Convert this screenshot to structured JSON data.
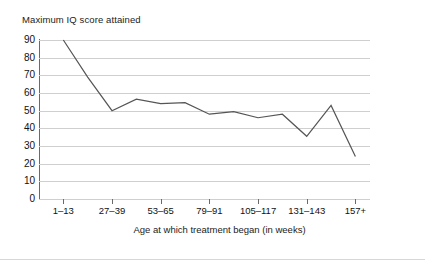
{
  "chart_data": {
    "type": "line",
    "title": "Maximum IQ score attained",
    "xlabel": "Age at which treatment began (in weeks)",
    "ylabel": "Maximum IQ score attained",
    "ylim": [
      0,
      90
    ],
    "ytick_labels": [
      "90",
      "80",
      "70",
      "60",
      "50",
      "40",
      "30",
      "20",
      "10",
      "0"
    ],
    "ytick_values": [
      90,
      80,
      70,
      60,
      50,
      40,
      30,
      20,
      10,
      0
    ],
    "grid": "horizontal",
    "legend": "none",
    "categories": [
      "1–13",
      "14–26",
      "27–39",
      "40–52",
      "53–65",
      "66–78",
      "79–91",
      "92–104",
      "105–117",
      "118–130",
      "131–143",
      "144–156",
      "157+"
    ],
    "xtick_labels": [
      "1–13",
      "27–39",
      "53–65",
      "79–91",
      "105–117",
      "131–143",
      "157+"
    ],
    "values": [
      90,
      69,
      50,
      56.5,
      54,
      54.5,
      48,
      49.5,
      46,
      48,
      35.5,
      53,
      24
    ],
    "line_color": "#555555",
    "grid_color": "#cfcfcf",
    "axis_color": "#6a6a6a"
  }
}
